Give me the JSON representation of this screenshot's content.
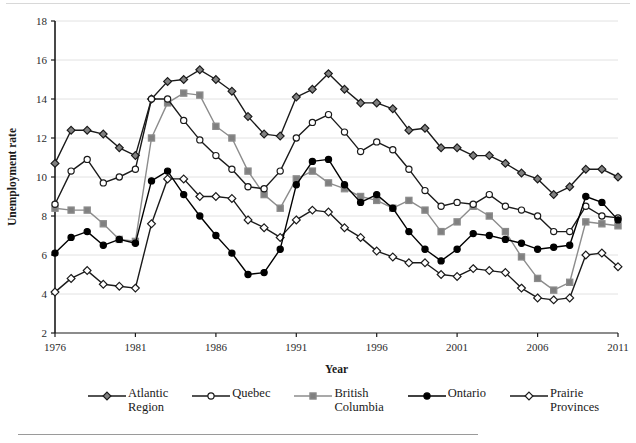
{
  "chart_data": {
    "type": "line",
    "title": "",
    "xlabel": "Year",
    "ylabel": "Unemployment rate",
    "xlim": [
      1976,
      2011
    ],
    "ylim": [
      2,
      18
    ],
    "ytick_step": 2,
    "xtick_step": 5,
    "grid": "horizontal",
    "legend_position": "bottom",
    "xticks": [
      "1976",
      "1981",
      "1986",
      "1991",
      "1996",
      "2001",
      "2006",
      "2011"
    ],
    "yticks": [
      "2",
      "4",
      "6",
      "8",
      "10",
      "12",
      "14",
      "16",
      "18"
    ],
    "x": [
      1976,
      1977,
      1978,
      1979,
      1980,
      1981,
      1982,
      1983,
      1984,
      1985,
      1986,
      1987,
      1988,
      1989,
      1990,
      1991,
      1992,
      1993,
      1994,
      1995,
      1996,
      1997,
      1998,
      1999,
      2000,
      2001,
      2002,
      2003,
      2004,
      2005,
      2006,
      2007,
      2008,
      2009,
      2010,
      2011
    ],
    "series": [
      {
        "name": "Atlantic Region",
        "marker": "diamond",
        "marker_fill": "#808080",
        "color": "#1a1a1a",
        "values": [
          10.7,
          12.4,
          12.4,
          12.2,
          11.5,
          11.1,
          14.0,
          14.9,
          15.0,
          15.5,
          15.0,
          14.4,
          13.1,
          12.2,
          12.1,
          14.1,
          14.5,
          15.3,
          14.5,
          13.8,
          13.8,
          13.5,
          12.4,
          12.5,
          11.5,
          11.5,
          11.1,
          11.1,
          10.7,
          10.2,
          9.9,
          9.1,
          9.5,
          10.4,
          10.4,
          10.0
        ]
      },
      {
        "name": "Quebec",
        "marker": "circle",
        "marker_fill": "#ffffff",
        "color": "#1a1a1a",
        "values": [
          8.6,
          10.3,
          10.9,
          9.7,
          10.0,
          10.4,
          14.0,
          14.0,
          12.9,
          11.9,
          11.1,
          10.4,
          9.5,
          9.4,
          10.3,
          12.0,
          12.8,
          13.2,
          12.3,
          11.3,
          11.8,
          11.4,
          10.4,
          9.3,
          8.5,
          8.7,
          8.6,
          9.1,
          8.5,
          8.3,
          8.0,
          7.2,
          7.2,
          8.5,
          8.0,
          7.9
        ]
      },
      {
        "name": "British Columbia",
        "marker": "square",
        "marker_fill": "#808080",
        "color": "#8c8c8c",
        "values": [
          8.4,
          8.3,
          8.3,
          7.6,
          6.8,
          6.7,
          12.0,
          13.8,
          14.3,
          14.2,
          12.6,
          12.0,
          10.3,
          9.1,
          8.4,
          9.9,
          10.3,
          9.7,
          9.4,
          9.0,
          8.8,
          8.4,
          8.8,
          8.3,
          7.2,
          7.7,
          8.5,
          8.0,
          7.2,
          5.9,
          4.8,
          4.2,
          4.6,
          7.7,
          7.6,
          7.5
        ]
      },
      {
        "name": "Ontario",
        "marker": "circle",
        "marker_fill": "#000000",
        "color": "#000000",
        "values": [
          6.1,
          6.9,
          7.2,
          6.5,
          6.8,
          6.6,
          9.8,
          10.3,
          9.1,
          8.0,
          7.0,
          6.1,
          5.0,
          5.1,
          6.3,
          9.6,
          10.8,
          10.9,
          9.6,
          8.7,
          9.1,
          8.4,
          7.2,
          6.3,
          5.7,
          6.3,
          7.1,
          7.0,
          6.8,
          6.6,
          6.3,
          6.4,
          6.5,
          9.0,
          8.7,
          7.8
        ]
      },
      {
        "name": "Prairie Provinces",
        "marker": "diamond",
        "marker_fill": "#ffffff",
        "color": "#1a1a1a",
        "values": [
          4.1,
          4.8,
          5.2,
          4.5,
          4.4,
          4.3,
          7.6,
          9.9,
          9.9,
          9.0,
          9.0,
          8.9,
          7.8,
          7.4,
          6.9,
          7.8,
          8.3,
          8.2,
          7.4,
          6.9,
          6.2,
          5.9,
          5.6,
          5.6,
          5.0,
          4.9,
          5.3,
          5.2,
          5.1,
          4.3,
          3.8,
          3.7,
          3.8,
          6.0,
          6.1,
          5.4
        ]
      }
    ]
  },
  "legend": {
    "items": [
      {
        "label_line1": "Atlantic",
        "label_line2": "Region"
      },
      {
        "label_line1": "Quebec",
        "label_line2": ""
      },
      {
        "label_line1": "British",
        "label_line2": "Columbia"
      },
      {
        "label_line1": "Ontario",
        "label_line2": ""
      },
      {
        "label_line1": "Prairie",
        "label_line2": "Provinces"
      }
    ]
  },
  "colors": {
    "axis": "#1a1a1a",
    "grid": "#e2e2e2",
    "gray_series": "#8c8c8c",
    "black_series": "#000000",
    "marker_gray_fill": "#808080",
    "marker_white_fill": "#ffffff"
  }
}
